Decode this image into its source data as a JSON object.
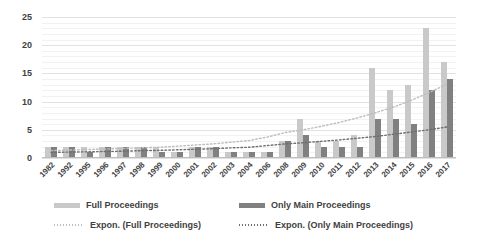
{
  "chart_data": {
    "type": "bar",
    "title": "",
    "subtitle": "",
    "xlabel": "",
    "ylabel": "",
    "ylim": [
      0,
      25
    ],
    "yticks": [
      0,
      5,
      10,
      15,
      20,
      25
    ],
    "grid": true,
    "legend_position": "bottom",
    "categories": [
      "1982",
      "1992",
      "1995",
      "1996",
      "1997",
      "1998",
      "1999",
      "2000",
      "2001",
      "2002",
      "2003",
      "2004",
      "2006",
      "2008",
      "2009",
      "2010",
      "2011",
      "2012",
      "2013",
      "2014",
      "2015",
      "2016",
      "2017"
    ],
    "series": [
      {
        "name": "Full Proceedings",
        "type": "bar",
        "color": "#c9c9c9",
        "values": [
          2,
          2,
          2,
          2,
          2,
          2,
          2,
          1,
          2,
          2,
          1,
          1,
          1,
          3,
          7,
          3,
          3,
          4,
          16,
          12,
          13,
          23,
          17
        ]
      },
      {
        "name": "Only Main Proceedings",
        "type": "bar",
        "color": "#808080",
        "values": [
          2,
          2,
          1,
          2,
          2,
          2,
          1,
          1,
          2,
          2,
          1,
          1,
          1,
          3,
          4,
          2,
          2,
          2,
          7,
          7,
          6,
          12,
          14
        ]
      },
      {
        "name": "Expon. (Full Proceedings)",
        "type": "trendline",
        "style": "dotted",
        "color": "#bdbdbd",
        "values": [
          1.3,
          1.4,
          1.5,
          1.6,
          1.7,
          1.8,
          1.9,
          2.1,
          2.3,
          2.5,
          2.8,
          3.1,
          3.7,
          4.5,
          5.0,
          5.6,
          6.3,
          7.1,
          8.0,
          9.0,
          10.2,
          11.6,
          13.1
        ]
      },
      {
        "name": "Expon. (Only Main Proceedings)",
        "type": "trendline",
        "style": "dotted",
        "color": "#6e6e6e",
        "values": [
          1.0,
          1.05,
          1.1,
          1.15,
          1.2,
          1.3,
          1.35,
          1.45,
          1.55,
          1.65,
          1.8,
          1.9,
          2.2,
          2.5,
          2.7,
          2.95,
          3.2,
          3.5,
          3.8,
          4.2,
          4.6,
          5.0,
          5.5
        ]
      }
    ]
  },
  "legend": {
    "items": [
      {
        "label": "Full Proceedings",
        "swatch": "bar-light-gray"
      },
      {
        "label": "Only Main Proceedings",
        "swatch": "bar-dark-gray"
      },
      {
        "label": "Expon. (Full Proceedings)",
        "swatch": "dotted-line-light"
      },
      {
        "label": "Expon. (Only Main Proceedings)",
        "swatch": "dotted-line-dark"
      }
    ]
  },
  "colors": {
    "bar_full": "#c9c9c9",
    "bar_main": "#808080",
    "trend_full": "#bdbdbd",
    "trend_main": "#6e6e6e",
    "gridline": "#e2e2e2",
    "text": "#3f3f3f",
    "background": "#ffffff"
  }
}
